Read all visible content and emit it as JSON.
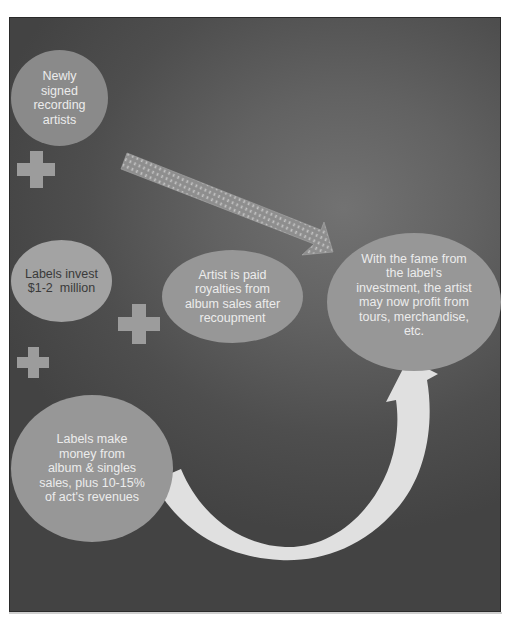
{
  "diagram": {
    "type": "flow",
    "colors": {
      "background_center": "#727272",
      "background_edge": "#434343",
      "bubble_dark": "#8a8a8a",
      "bubble_light": "#a3a3a3",
      "bubble_mid": "#979797",
      "plus": "#9c9c9c",
      "curved_arrow": "#e2e2e2",
      "striped_arrow": "#9a9a9a",
      "text_light": "#ececec",
      "text_dark": "#3a3a3a"
    },
    "nodes": [
      {
        "id": "artists",
        "text": "Newly signed recording artists"
      },
      {
        "id": "invest",
        "text": "Labels invest $1-2  million"
      },
      {
        "id": "royalties",
        "text": "Artist is paid royalties from album sales after recoupment"
      },
      {
        "id": "profit",
        "text": "With the fame from the label's investment, the artist may now profit from tours, merchandise, etc."
      },
      {
        "id": "labels_make",
        "text": "Labels make money from album & singles sales, plus 10-15% of act's revenues"
      }
    ],
    "node_lines": {
      "artists": [
        "Newly",
        "signed",
        "recording",
        "artists"
      ],
      "invest": [
        "Labels invest",
        "$1-2  million"
      ],
      "royalties": [
        "Artist is paid",
        "royalties from",
        "album sales after",
        "recoupment"
      ],
      "profit": [
        "With the fame from",
        "the label's",
        "investment, the artist",
        "may now profit from",
        "tours, merchandise,",
        "etc."
      ],
      "labels_make": [
        "Labels make",
        "money from",
        "album & singles",
        "sales, plus 10-15%",
        "of act's revenues"
      ]
    },
    "connectors": [
      {
        "type": "plus",
        "label": "+"
      },
      {
        "type": "plus",
        "label": "+"
      },
      {
        "type": "plus",
        "label": "+"
      },
      {
        "type": "striped-arrow",
        "from": "artists",
        "to": "profit"
      },
      {
        "type": "curved-arrow",
        "from": "labels_make",
        "to": "profit"
      }
    ]
  }
}
